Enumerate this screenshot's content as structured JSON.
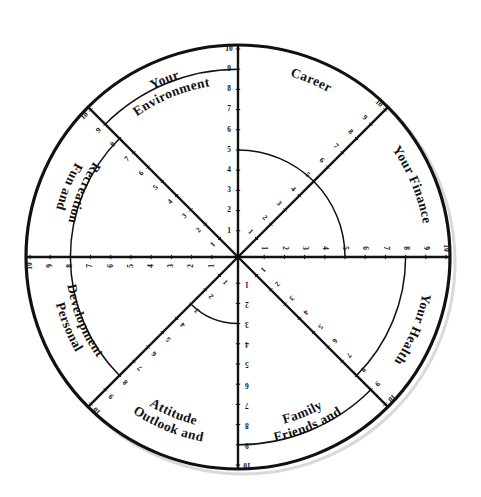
{
  "diagram": {
    "type": "radar-wheel",
    "center": {
      "x": 238,
      "y": 257
    },
    "outer_radius": 212,
    "scale": {
      "min": 1,
      "max": 10,
      "tick_labels": [
        "1",
        "2",
        "3",
        "4",
        "5",
        "6",
        "7",
        "8",
        "9",
        "10"
      ]
    },
    "colors": {
      "ink": "#111111",
      "paper": "#ffffff",
      "shadow": "#b9b9b9"
    },
    "sectors": [
      {
        "id": "career",
        "label": "Career",
        "label_lines": [
          "Career"
        ],
        "score": 5,
        "axis_angle_deg": -90,
        "sector_mid_deg": -67.5,
        "flip": false
      },
      {
        "id": "your-finance",
        "label": "Your Finance",
        "label_lines": [
          "Your Finance"
        ],
        "score": 5,
        "axis_angle_deg": -45,
        "sector_mid_deg": -22.5,
        "flip": false
      },
      {
        "id": "your-health",
        "label": "Your Health",
        "label_lines": [
          "Your Health"
        ],
        "score": 8,
        "axis_angle_deg": 0,
        "sector_mid_deg": 22.5,
        "flip": false
      },
      {
        "id": "friends-and-family",
        "label": "Friends and Family",
        "label_lines": [
          "Friends and",
          "Family"
        ],
        "score": 9,
        "axis_angle_deg": 45,
        "sector_mid_deg": 67.5,
        "flip": true
      },
      {
        "id": "outlook-and-attitude",
        "label": "Outlook and Attitude",
        "label_lines": [
          "Outlook and",
          "Attitude"
        ],
        "score": 3,
        "axis_angle_deg": 90,
        "sector_mid_deg": 112.5,
        "flip": true
      },
      {
        "id": "personal-development",
        "label": "Personal Development",
        "label_lines": [
          "Personal",
          "Development"
        ],
        "score": 8,
        "axis_angle_deg": 135,
        "sector_mid_deg": 157.5,
        "flip": true
      },
      {
        "id": "fun-and-recreation",
        "label": "Fun and Recreation",
        "label_lines": [
          "Fun and",
          "Recreation"
        ],
        "score": 8,
        "axis_angle_deg": 180,
        "sector_mid_deg": 202.5,
        "flip": true
      },
      {
        "id": "your-environment",
        "label": "Your Environment",
        "label_lines": [
          "Your",
          "Environment"
        ],
        "score": 9,
        "axis_angle_deg": 225,
        "sector_mid_deg": 247.5,
        "flip": false
      }
    ],
    "axes": [
      {
        "id": "axis-up",
        "angle_deg": -90,
        "numbers_side": "left",
        "numbers_upright": true,
        "labels": [
          "1",
          "2",
          "3",
          "4",
          "5",
          "6",
          "7",
          "8",
          "9",
          "10"
        ]
      },
      {
        "id": "axis-up-right",
        "angle_deg": -45,
        "numbers_side": "left",
        "numbers_upright": false,
        "labels": [
          "1",
          "2",
          "3",
          "4",
          "5",
          "6",
          "7",
          "8",
          "9",
          "10"
        ]
      },
      {
        "id": "axis-right",
        "angle_deg": 0,
        "numbers_side": "left",
        "numbers_upright": false,
        "labels": [
          "1",
          "2",
          "3",
          "4",
          "5",
          "6",
          "7",
          "8",
          "9",
          "10"
        ]
      },
      {
        "id": "axis-down-right",
        "angle_deg": 45,
        "numbers_side": "left",
        "numbers_upright": false,
        "labels": [
          "1",
          "2",
          "3",
          "4",
          "5",
          "6",
          "7",
          "8",
          "9",
          "10"
        ]
      },
      {
        "id": "axis-down",
        "angle_deg": 90,
        "numbers_side": "left",
        "numbers_upright": false,
        "labels": [
          "1",
          "2",
          "3",
          "4",
          "5",
          "6",
          "7",
          "8",
          "9",
          "10"
        ]
      },
      {
        "id": "axis-down-left",
        "angle_deg": 135,
        "numbers_side": "left",
        "numbers_upright": false,
        "labels": [
          "1",
          "2",
          "3",
          "4",
          "5",
          "6",
          "7",
          "8",
          "9",
          "10"
        ]
      },
      {
        "id": "axis-left",
        "angle_deg": 180,
        "numbers_side": "left",
        "numbers_upright": false,
        "labels": [
          "1",
          "2",
          "3",
          "4",
          "5",
          "6",
          "7",
          "8",
          "9",
          "10"
        ]
      },
      {
        "id": "axis-up-left",
        "angle_deg": 225,
        "numbers_side": "left",
        "numbers_upright": false,
        "labels": [
          "1",
          "2",
          "3",
          "4",
          "5",
          "6",
          "7",
          "8",
          "9",
          "10"
        ]
      }
    ]
  },
  "chart_data": {
    "type": "radar",
    "categories": [
      "Career",
      "Your Finance",
      "Your Health",
      "Friends and Family",
      "Outlook and Attitude",
      "Personal Development",
      "Fun and Recreation",
      "Your Environment"
    ],
    "values": [
      5,
      5,
      8,
      9,
      3,
      8,
      8,
      9
    ],
    "ylim": [
      0,
      10
    ],
    "ylabel": "",
    "xlabel": "",
    "grid": false,
    "legend": "none"
  }
}
